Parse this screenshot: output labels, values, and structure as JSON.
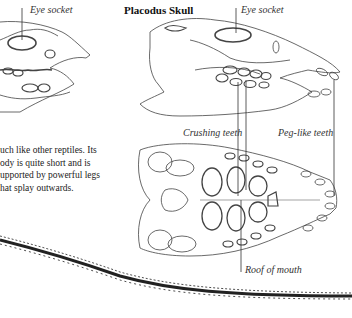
{
  "page": {
    "title": "Placodus Skull",
    "labels": {
      "left_eye_socket": "Eye socket",
      "right_eye_socket": "Eye socket",
      "crushing_teeth": "Crushing teeth",
      "peg_like_teeth": "Peg-like teeth",
      "roof_of_mouth": "Roof of mouth"
    },
    "body_text": [
      "uch like other reptiles. Its",
      "ody is quite short and is",
      "upported by powerful legs",
      "hat splay outwards."
    ],
    "colors": {
      "ink": "#333333",
      "background": "#ffffff"
    }
  }
}
